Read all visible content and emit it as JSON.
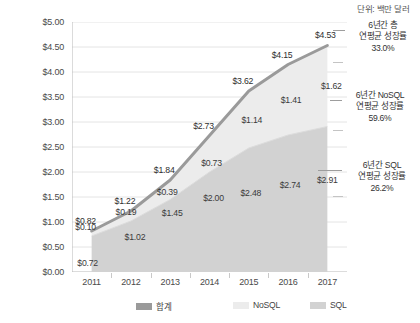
{
  "unit_note": "단위: 백만 달러",
  "legend": {
    "position": "bottom",
    "items": [
      {
        "label": "합계",
        "color": "#9a9a9a",
        "left": 136
      },
      {
        "label": "NoSQL",
        "color": "#ececec",
        "left": 233
      },
      {
        "label": "SQL",
        "color": "#d2d2d2",
        "left": 310
      }
    ]
  },
  "annotations": [
    {
      "line1": "6년간 총",
      "line2": "연평균 성장률",
      "line3": "33.0%"
    },
    {
      "line1": "6년간 NoSQL",
      "line2": "연평균 성장률",
      "line3": "59.6%"
    },
    {
      "line1": "6년간 SQL",
      "line2": "연평균 성장률",
      "line3": "26.2%"
    }
  ],
  "chart_data": {
    "type": "area",
    "title": "",
    "subtitle": "",
    "xlabel": "",
    "ylabel": "",
    "unit": "단위: 백만 달러",
    "categories": [
      "2011",
      "2012",
      "2013",
      "2014",
      "2015",
      "2016",
      "2017"
    ],
    "ylim": [
      0,
      5
    ],
    "ytick_step": 0.5,
    "ytick_labels": [
      "$0.00",
      "$0.50",
      "$1.00",
      "$1.50",
      "$2.00",
      "$2.50",
      "$3.00",
      "$3.50",
      "$4.00",
      "$4.50",
      "$5.00"
    ],
    "ytick_values": [
      0,
      0.5,
      1,
      1.5,
      2,
      2.5,
      3,
      3.5,
      4,
      4.5,
      5
    ],
    "grid": true,
    "legend_position": "bottom",
    "stacked": true,
    "series": [
      {
        "name": "SQL",
        "color": "#d2d2d2",
        "values": [
          0.72,
          1.02,
          1.45,
          2.0,
          2.48,
          2.74,
          2.91
        ],
        "labels": [
          "$0.72",
          "$1.02",
          "$1.45",
          "$2.00",
          "$2.48",
          "$2.74",
          "$2.91"
        ],
        "cagr": "26.2%"
      },
      {
        "name": "NoSQL",
        "color": "#ececec",
        "values": [
          0.1,
          0.19,
          0.39,
          0.73,
          1.14,
          1.41,
          1.62
        ],
        "labels": [
          "$0.10",
          "$0.19",
          "$0.39",
          "$0.73",
          "$1.14",
          "$1.41",
          "$1.62"
        ],
        "cagr": "59.6%"
      },
      {
        "name": "합계",
        "color": "#9a9a9a",
        "values": [
          0.82,
          1.22,
          1.84,
          2.73,
          3.62,
          4.15,
          4.53
        ],
        "labels": [
          "$0.82",
          "$1.22",
          "$1.84",
          "$2.73",
          "$3.62",
          "$4.15",
          "$4.53"
        ],
        "cagr": "33.0%"
      }
    ]
  }
}
